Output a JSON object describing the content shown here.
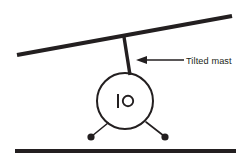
{
  "figure": {
    "background_color": "#ffffff",
    "ink_color": "#231f20",
    "annotations": [
      {
        "id": "tilted-mast",
        "label": "Tilted mast",
        "pointer": "arrow-left",
        "target": "mast"
      }
    ],
    "elements": {
      "beam": {
        "name": "tilted-beam",
        "x1": 17,
        "y1": 55,
        "x2": 232,
        "y2": 16
      },
      "ground": {
        "name": "ground-line",
        "x1": 15,
        "y1": 151,
        "x2": 236,
        "y2": 151
      },
      "mast": {
        "name": "mast-line",
        "x1": 124,
        "y1": 37,
        "x2": 130,
        "y2": 75
      },
      "body": {
        "name": "body-circle",
        "cx": 125,
        "cy": 101,
        "r": 28
      },
      "glyph": {
        "name": "instrument-glyph",
        "symbol": "bar-and-ring",
        "bar_x": 118,
        "bar_y1": 94,
        "bar_y2": 108,
        "ring_cx": 128,
        "ring_cy": 101,
        "ring_r": 5.2
      },
      "leg_left": {
        "name": "left-leg",
        "x1": 108,
        "y1": 123,
        "x2": 92,
        "y2": 136
      },
      "leg_right": {
        "name": "right-leg",
        "x1": 146,
        "y1": 122,
        "x2": 164,
        "y2": 136
      },
      "foot_left": {
        "name": "left-foot-dot",
        "cx": 91,
        "cy": 137,
        "r": 3.6
      },
      "foot_right": {
        "name": "right-foot-dot",
        "cx": 165,
        "cy": 137,
        "r": 3.6
      },
      "leader_line": {
        "name": "annotation-leader-line",
        "x1": 146,
        "y1": 60,
        "x2": 184,
        "y2": 60
      },
      "arrow_head": {
        "name": "annotation-arrow-head",
        "tip_x": 136,
        "tip_y": 60,
        "points": "136,60 147,56 147,64"
      },
      "label": {
        "name": "annotation-label",
        "x": 186,
        "y": 64
      }
    }
  }
}
